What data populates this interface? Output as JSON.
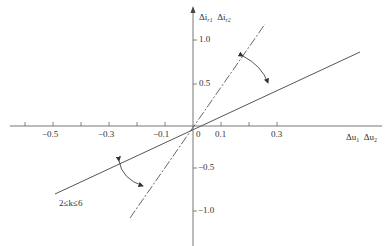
{
  "diagram": {
    "axes": {
      "x_label_1": "Δu",
      "x_sub_1": "1",
      "x_label_2": "Δu",
      "x_sub_2": "2",
      "y_label_1": "Δi",
      "y_sub_1": "r1",
      "y_label_2": "Δi",
      "y_sub_2": "r2"
    },
    "x_ticks": [
      {
        "label": "−0.5",
        "x": 53
      },
      {
        "label": "−0.3",
        "x": 109
      },
      {
        "label": "−0.1",
        "x": 165
      },
      {
        "label": "0",
        "x": 197
      },
      {
        "label": "0.1",
        "x": 221
      },
      {
        "label": "0.3",
        "x": 277
      }
    ],
    "y_ticks": [
      {
        "label": "1.0",
        "y": 40
      },
      {
        "label": "0.5",
        "y": 84
      },
      {
        "label": "−0.5",
        "y": 168
      },
      {
        "label": "−1.0",
        "y": 211
      }
    ],
    "annotation": "2≤k≤6",
    "colors": {
      "axis": "#666666",
      "line": "#555555",
      "text": "#333333"
    }
  }
}
